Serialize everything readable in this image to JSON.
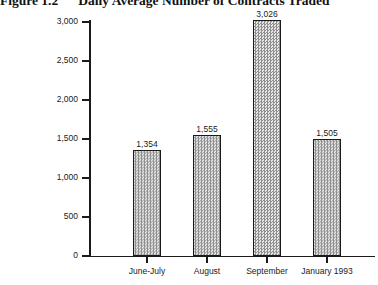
{
  "figure": {
    "label": "Figure 1.2",
    "title": "Daily Average Number of Contracts Traded"
  },
  "chart_data": {
    "type": "bar",
    "title": "Daily Average Number of Contracts Traded",
    "figure_label": "Figure 1.2",
    "categories": [
      "June-July",
      "August",
      "September",
      "January 1993"
    ],
    "values": [
      1354,
      1555,
      3026,
      1505
    ],
    "value_labels": [
      "1,354",
      "1,555",
      "3,026",
      "1,505"
    ],
    "xlabel": "",
    "ylabel": "",
    "ylim": [
      0,
      3000
    ],
    "yticks": [
      0,
      500,
      1000,
      1500,
      2000,
      2500,
      3000
    ],
    "ytick_labels": [
      "0",
      "500",
      "1,000",
      "1,500",
      "2,000",
      "2,500",
      "3,000"
    ],
    "grid": false,
    "legend": false,
    "bar_fill": "halftone-checker-gray",
    "bar_edge_color": "#1a1a1a",
    "axis_color": "#1a1a1a"
  }
}
